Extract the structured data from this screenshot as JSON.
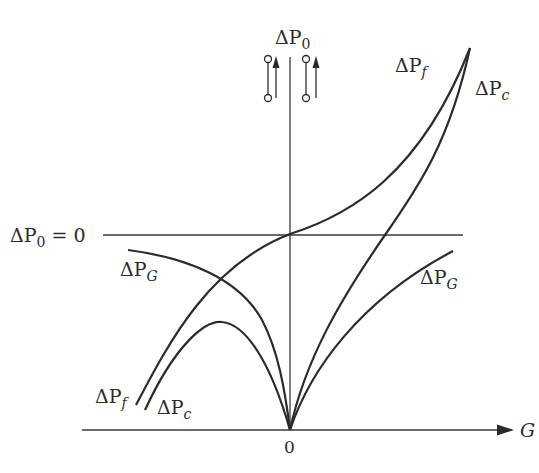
{
  "diagram": {
    "type": "function-curves",
    "axes": {
      "y_label_base": "ΔP",
      "y_label_sub": "0",
      "x_label": "G",
      "origin_label": "0",
      "zero_line_label_base": "ΔP",
      "zero_line_label_sub": "0",
      "zero_line_label_suffix": " = 0"
    },
    "curves": [
      {
        "id": "dPf",
        "label_base": "ΔP",
        "label_sub": "f",
        "description": "rises monotonically from lower-left, through ΔP0=0 at G=0, up to upper-right"
      },
      {
        "id": "dPc",
        "label_base": "ΔP",
        "label_sub": "c",
        "description": "left branch arc peaking below zero line into origin; right branch rises from origin through zero line to upper-right"
      },
      {
        "id": "dPG",
        "label_base": "ΔP",
        "label_sub": "G",
        "description": "left branch falls from below zero line into origin; right branch rises from origin staying below zero line"
      }
    ],
    "labels": {
      "pf_left": {
        "base": "ΔP",
        "sub": "f"
      },
      "pc_left": {
        "base": "ΔP",
        "sub": "c"
      },
      "pg_left": {
        "base": "ΔP",
        "sub": "G"
      },
      "pf_right": {
        "base": "ΔP",
        "sub": "f"
      },
      "pc_right": {
        "base": "ΔP",
        "sub": "c"
      },
      "pg_right": {
        "base": "ΔP",
        "sub": "G"
      }
    },
    "symbols": [
      {
        "name": "valve-arrow-up-left",
        "position": "left of vertical axis"
      },
      {
        "name": "valve-arrow-up-right",
        "position": "right of vertical axis"
      }
    ],
    "colors": {
      "ink": "#2b2b2b",
      "background": "#ffffff"
    }
  }
}
